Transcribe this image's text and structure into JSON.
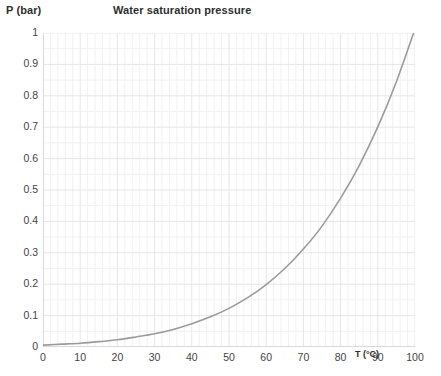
{
  "labels": {
    "y_axis_title": "P (bar)",
    "title": "Water saturation pressure",
    "x_axis_title": "T (°C)"
  },
  "colors": {
    "curve": "#9b9b9b",
    "major_gridline": "#e6e6e6",
    "minor_gridline": "#f1f1f1",
    "axis": "#d9d9d9",
    "text": "#444444",
    "heading": "#2e2e2e",
    "background": "#ffffff"
  },
  "chart_data": {
    "type": "line",
    "title": "Water saturation pressure",
    "xlabel": "T (°C)",
    "ylabel": "P (bar)",
    "xlim": [
      0,
      100
    ],
    "ylim": [
      0,
      1
    ],
    "grid": true,
    "legend": "none",
    "xticks": [
      0,
      10,
      20,
      30,
      40,
      50,
      60,
      70,
      80,
      90,
      100
    ],
    "xtick_labels": [
      "0",
      "10",
      "20",
      "30",
      "40",
      "50",
      "60",
      "70",
      "80",
      "90",
      "100"
    ],
    "yticks": [
      0,
      0.1,
      0.2,
      0.3,
      0.4,
      0.5,
      0.6,
      0.7,
      0.8,
      0.9,
      1
    ],
    "ytick_labels": [
      "0",
      "0.1",
      "0.2",
      "0.3",
      "0.4",
      "0.5",
      "0.6",
      "0.7",
      "0.8",
      "0.9",
      "1"
    ],
    "x_minor_divisions": 5,
    "y_minor_divisions": 2,
    "series": [
      {
        "name": "Water saturation pressure",
        "x": [
          0,
          5,
          10,
          15,
          20,
          25,
          30,
          35,
          40,
          45,
          50,
          55,
          60,
          65,
          70,
          75,
          80,
          85,
          90,
          95,
          100
        ],
        "y": [
          0.006,
          0.009,
          0.012,
          0.017,
          0.023,
          0.032,
          0.042,
          0.056,
          0.074,
          0.096,
          0.123,
          0.157,
          0.199,
          0.25,
          0.312,
          0.385,
          0.474,
          0.578,
          0.701,
          0.845,
          1.013
        ]
      }
    ]
  }
}
